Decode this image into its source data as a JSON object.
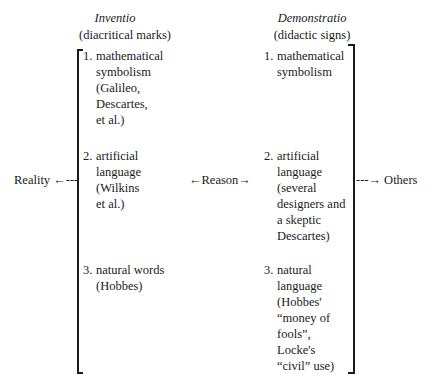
{
  "left_column": {
    "title": "Inventio",
    "subtitle": "(diacritical marks)",
    "items": [
      {
        "number": "1.",
        "lines": [
          "mathematical",
          "symbolism",
          "(Galileo,",
          "Descartes,",
          "et al.)"
        ]
      },
      {
        "number": "2.",
        "lines": [
          "artificial",
          "language",
          "(Wilkins",
          "et al.)"
        ]
      },
      {
        "number": "3.",
        "lines": [
          "natural words",
          "(Hobbes)"
        ]
      }
    ]
  },
  "right_column": {
    "title": "Demonstratio",
    "subtitle": "(didactic signs)",
    "items": [
      {
        "number": "1.",
        "lines": [
          "mathematical",
          "symbolism"
        ]
      },
      {
        "number": "2.",
        "lines": [
          "artificial",
          "language",
          "(several",
          "designers and",
          "a skeptic",
          "Descartes)"
        ]
      },
      {
        "number": "3.",
        "lines": [
          "natural",
          "language",
          "(Hobbes'",
          "“money of",
          "fools”,",
          "Locke's",
          "“civil” use)"
        ]
      }
    ]
  },
  "connectors": {
    "left": "Reality ←---",
    "middle": "←Reason→",
    "right": "---→ Others"
  }
}
